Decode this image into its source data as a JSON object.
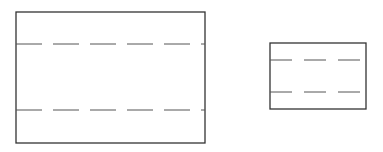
{
  "diagram": {
    "stroke_color": "#333333",
    "dash_color": "#555555",
    "shapes": [
      {
        "name": "large-rectangle",
        "x": 16,
        "y": 12,
        "width": 189,
        "height": 131,
        "dashed_lines_y": [
          44,
          110
        ],
        "dash_pattern": "26 11"
      },
      {
        "name": "small-rectangle",
        "x": 270,
        "y": 43,
        "width": 96,
        "height": 66,
        "dashed_lines_y": [
          60,
          92
        ],
        "dash_pattern": "22 12"
      }
    ]
  }
}
